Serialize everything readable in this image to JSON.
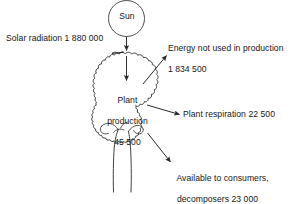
{
  "diagram": {
    "type": "energy-flow-diagram",
    "stroke_color": "#2a2a2a",
    "text_color": "#161616",
    "background": "#ffffff",
    "source_node": {
      "name": "sun-node",
      "label": "Sun",
      "shape": "circle"
    },
    "producer_node": {
      "name": "tree",
      "label": ""
    },
    "labels": {
      "solar_radiation": "Solar radiation 1 880 000",
      "energy_not_used_line1": "Energy not used in production",
      "energy_not_used_line2": "1 834 500",
      "plant_production_line1": "Plant",
      "plant_production_line2": "production",
      "plant_production_line3": "45 500",
      "plant_respiration": "Plant respiration 22 500",
      "available_line1": "Available to consumers,",
      "available_line2": "decomposers 23 000"
    },
    "flows": [
      {
        "name": "solar-radiation-flow",
        "label": "Solar radiation",
        "value": "1 880 000",
        "direction": "down"
      },
      {
        "name": "energy-not-used-flow",
        "label": "Energy not used in production",
        "value": "1 834 500",
        "direction": "up-right"
      },
      {
        "name": "plant-production-flow",
        "label": "Plant production",
        "value": "45 500",
        "direction": "down"
      },
      {
        "name": "plant-respiration-flow",
        "label": "Plant respiration",
        "value": "22 500",
        "direction": "right"
      },
      {
        "name": "available-flow",
        "label": "Available to consumers, decomposers",
        "value": "23 000",
        "direction": "down-right"
      }
    ]
  }
}
